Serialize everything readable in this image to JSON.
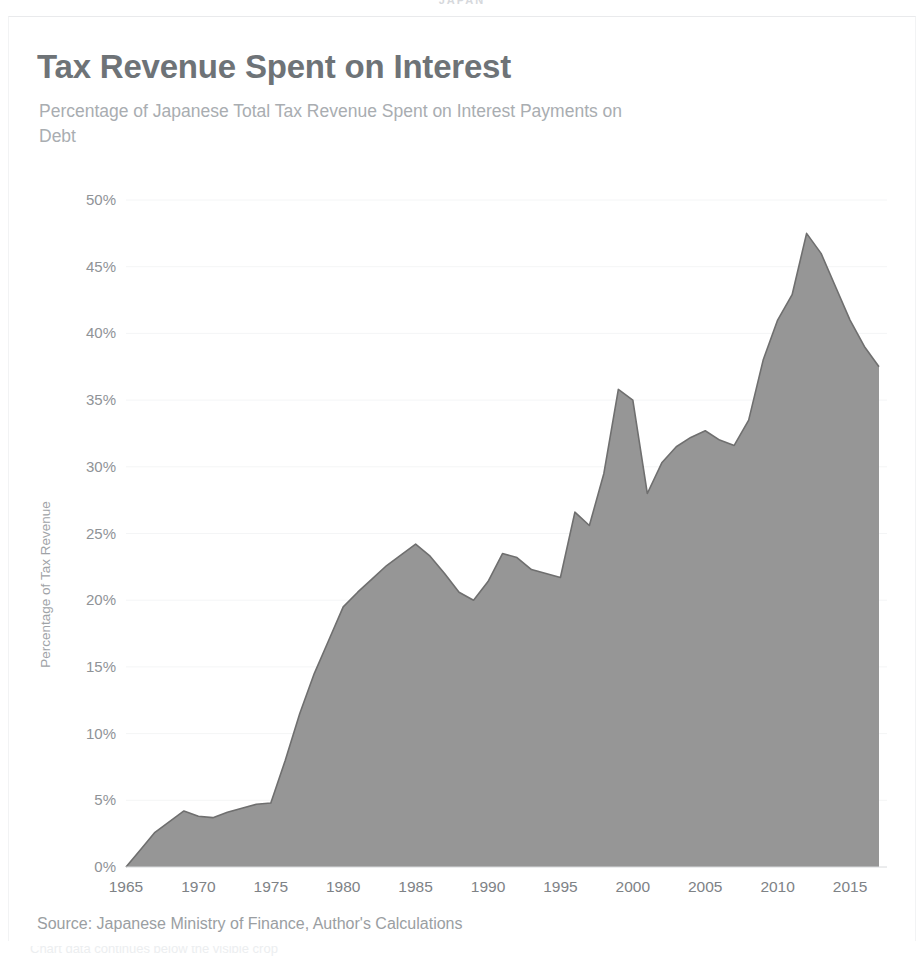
{
  "page": {
    "header_label": "JAPAN",
    "footer_caption": "Chart data continues below the visible crop"
  },
  "chart": {
    "title": "Tax Revenue Spent on Interest",
    "subtitle": "Percentage of Japanese Total Tax Revenue Spent on Interest Payments on Debt",
    "source": "Source: Japanese Ministry of Finance, Author's Calculations",
    "colors": {
      "area_fill": "#969696",
      "area_stroke": "#6f6f6f",
      "title": "#6e7377",
      "subtitle": "#a9adb1",
      "axis_text": "#8f9397",
      "gridline": "#f4f5f6",
      "background": "#ffffff"
    }
  },
  "chart_data": {
    "type": "area",
    "title": "Tax Revenue Spent on Interest",
    "subtitle": "Percentage of Japanese Total Tax Revenue Spent on Interest Payments on Debt",
    "xlabel": "",
    "ylabel": "Percentage of Tax Revenue",
    "xlim": [
      1965,
      2017
    ],
    "ylim": [
      0,
      50
    ],
    "grid": true,
    "legend": false,
    "y_tick_labels": [
      "0%",
      "5%",
      "10%",
      "15%",
      "20%",
      "25%",
      "30%",
      "35%",
      "40%",
      "45%",
      "50%"
    ],
    "y_tick_values": [
      0,
      5,
      10,
      15,
      20,
      25,
      30,
      35,
      40,
      45,
      50
    ],
    "x_tick_labels": [
      "1965",
      "1970",
      "1975",
      "1980",
      "1985",
      "1990",
      "1995",
      "2000",
      "2005",
      "2010",
      "2015"
    ],
    "x_tick_values": [
      1965,
      1970,
      1975,
      1980,
      1985,
      1990,
      1995,
      2000,
      2005,
      2010,
      2015
    ],
    "series": [
      {
        "name": "Percentage of Tax Revenue Spent on Interest",
        "x": [
          1965,
          1966,
          1967,
          1968,
          1969,
          1970,
          1971,
          1972,
          1973,
          1974,
          1975,
          1976,
          1977,
          1978,
          1979,
          1980,
          1981,
          1982,
          1983,
          1984,
          1985,
          1986,
          1987,
          1988,
          1989,
          1990,
          1991,
          1992,
          1993,
          1994,
          1995,
          1996,
          1997,
          1998,
          1999,
          2000,
          2001,
          2002,
          2003,
          2004,
          2005,
          2006,
          2007,
          2008,
          2009,
          2010,
          2011,
          2012,
          2013,
          2014,
          2015,
          2016,
          2017
        ],
        "values": [
          0.0,
          1.3,
          2.6,
          3.4,
          4.2,
          3.8,
          3.7,
          4.1,
          4.4,
          4.7,
          4.8,
          8.0,
          11.5,
          14.5,
          17.0,
          19.5,
          20.6,
          21.6,
          22.6,
          23.4,
          24.2,
          23.3,
          22.0,
          20.6,
          20.0,
          21.4,
          23.5,
          23.2,
          22.3,
          22.0,
          21.7,
          26.6,
          25.6,
          29.5,
          35.8,
          35.0,
          28.0,
          30.3,
          31.5,
          32.2,
          32.7,
          32.0,
          31.6,
          33.5,
          38.0,
          41.0,
          42.9,
          47.5,
          46.0,
          43.5,
          41.0,
          39.0,
          37.5
        ]
      }
    ]
  }
}
